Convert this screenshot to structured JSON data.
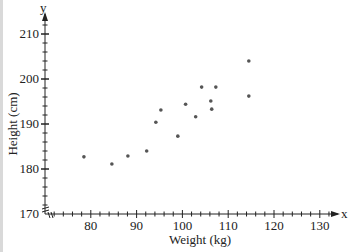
{
  "chart_data": {
    "type": "scatter",
    "title": "",
    "xlabel": "Weight (kg)",
    "ylabel": "Height (cm)",
    "x_axis_letter": "x",
    "y_axis_letter": "y",
    "xlim": [
      70,
      133
    ],
    "ylim": [
      170,
      213
    ],
    "x_ticks": [
      80,
      90,
      100,
      110,
      120,
      130
    ],
    "y_ticks": [
      170,
      180,
      190,
      200,
      210
    ],
    "x_minor_step": 2,
    "y_minor_step": 2,
    "grid": false,
    "legend": null,
    "axis_break_at_origin": true,
    "series": [
      {
        "name": "data",
        "color": "#555555",
        "points": [
          {
            "x": 78.5,
            "y": 182.7
          },
          {
            "x": 84.6,
            "y": 181.1
          },
          {
            "x": 88.1,
            "y": 182.9
          },
          {
            "x": 92.2,
            "y": 184.0
          },
          {
            "x": 94.2,
            "y": 190.4
          },
          {
            "x": 95.3,
            "y": 193.1
          },
          {
            "x": 99.0,
            "y": 187.3
          },
          {
            "x": 100.7,
            "y": 194.4
          },
          {
            "x": 102.9,
            "y": 191.6
          },
          {
            "x": 104.2,
            "y": 198.2
          },
          {
            "x": 106.2,
            "y": 195.1
          },
          {
            "x": 106.4,
            "y": 193.3
          },
          {
            "x": 107.3,
            "y": 198.2
          },
          {
            "x": 114.5,
            "y": 204.0
          },
          {
            "x": 114.5,
            "y": 196.2
          }
        ]
      }
    ]
  }
}
